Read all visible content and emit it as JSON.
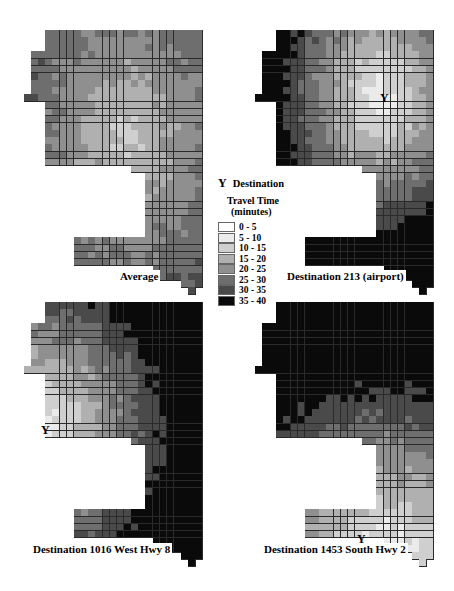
{
  "legend": {
    "destination_symbol": "Y",
    "destination_label": "Destination",
    "title_line1": "Travel Time",
    "title_line2": "(minutes)",
    "items": [
      {
        "label": "0 - 5",
        "color": "#ffffff"
      },
      {
        "label": "5 - 10",
        "color": "#ebebeb"
      },
      {
        "label": "10 - 15",
        "color": "#cfcfcf"
      },
      {
        "label": "15 - 20",
        "color": "#b0b0b0"
      },
      {
        "label": "20 - 25",
        "color": "#8f8f8f"
      },
      {
        "label": "25 - 30",
        "color": "#6e6e6e"
      },
      {
        "label": "30 - 35",
        "color": "#4a4a4a"
      },
      {
        "label": "35 - 40",
        "color": "#0a0a0a"
      }
    ]
  },
  "maps": [
    {
      "id": "average",
      "label": "Average",
      "origin": [
        31,
        30
      ],
      "label_pos": [
        118,
        270
      ],
      "dest": null,
      "pattern": "average"
    },
    {
      "id": "dest213",
      "label": "Destination 213 (airport)",
      "origin": [
        262,
        30
      ],
      "label_pos": [
        285,
        270
      ],
      "dest": {
        "symbol": "Y",
        "x": 380,
        "y": 92
      },
      "pattern": "airport"
    },
    {
      "id": "dest1016",
      "label": "Destination 1016 West Hwy 8",
      "origin": [
        31,
        302
      ],
      "label_pos": [
        31,
        543
      ],
      "dest": {
        "symbol": "Y",
        "x": 41,
        "y": 424
      },
      "pattern": "west"
    },
    {
      "id": "dest1453",
      "label": "Destination 1453 South Hwy 2",
      "origin": [
        262,
        302
      ],
      "label_pos": [
        262,
        543
      ],
      "dest": {
        "symbol": "Y",
        "x": 357,
        "y": 533
      },
      "pattern": "south"
    }
  ],
  "chart_data": {
    "type": "heatmap",
    "title": "Travel Time (minutes)",
    "legend": [
      "0 - 5",
      "5 - 10",
      "10 - 15",
      "15 - 20",
      "20 - 25",
      "25 - 30",
      "30 - 35",
      "35 - 40"
    ],
    "panels": [
      "Average",
      "Destination 213 (airport)",
      "Destination 1016 West Hwy 8",
      "Destination 1453 South Hwy 2"
    ]
  }
}
